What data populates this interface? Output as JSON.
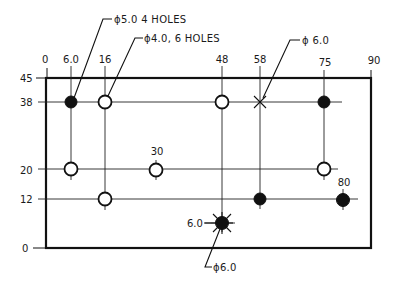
{
  "drawing": {
    "title": "Hole location drawing (rectangular plate)",
    "units": "",
    "plate": {
      "x_min": 0,
      "x_max": 90,
      "y_min": 0,
      "y_max": 45
    },
    "x_dimensions": [
      "0",
      "6.0",
      "16",
      "48",
      "58",
      "75",
      "90"
    ],
    "y_dimensions": [
      "45",
      "38",
      "20",
      "12",
      "0"
    ],
    "inline_labels": {
      "x30": "30",
      "x80": "80",
      "y6": "6.0"
    },
    "callouts": {
      "phi5_4holes": "ϕ5.0 4 HOLES",
      "phi4_6holes": "ϕ4.0, 6 HOLES",
      "phi6_top": "ϕ 6.0",
      "phi6_bottom": "ϕ6.0"
    },
    "holes": [
      {
        "x": 6,
        "y": 38,
        "type": "filled",
        "diameter": "5.0"
      },
      {
        "x": 16,
        "y": 38,
        "type": "open",
        "diameter": "4.0"
      },
      {
        "x": 48,
        "y": 38,
        "type": "open",
        "diameter": "4.0"
      },
      {
        "x": 58,
        "y": 38,
        "type": "cross",
        "diameter": "6.0"
      },
      {
        "x": 75,
        "y": 38,
        "type": "filled",
        "diameter": "5.0"
      },
      {
        "x": 6,
        "y": 20,
        "type": "open",
        "diameter": "4.0"
      },
      {
        "x": 30,
        "y": 20,
        "type": "open",
        "diameter": "4.0"
      },
      {
        "x": 75,
        "y": 20,
        "type": "open",
        "diameter": "4.0"
      },
      {
        "x": 16,
        "y": 12,
        "type": "open",
        "diameter": "4.0"
      },
      {
        "x": 58,
        "y": 12,
        "type": "filled",
        "diameter": "5.0"
      },
      {
        "x": 80,
        "y": 12,
        "type": "filled",
        "diameter": "5.0"
      },
      {
        "x": 48,
        "y": 6,
        "type": "star",
        "diameter": "6.0"
      }
    ],
    "colors": {
      "ink": "#111111",
      "paper": "#ffffff"
    }
  }
}
